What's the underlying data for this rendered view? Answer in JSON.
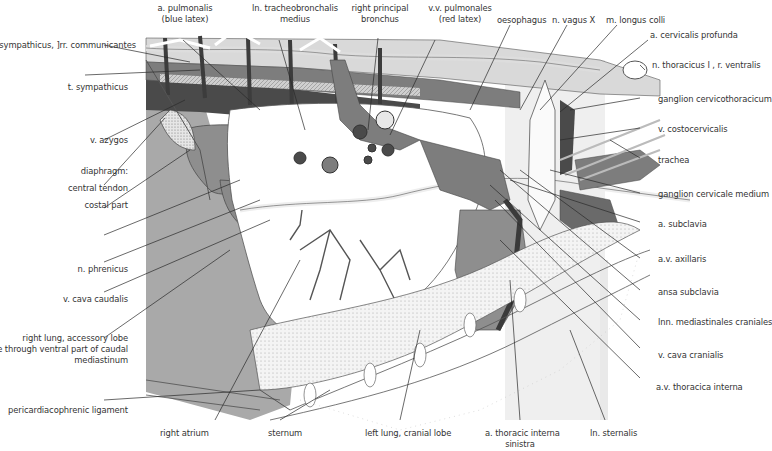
{
  "figure": {
    "type": "anatomical illustration",
    "colors": {
      "background": "#ffffff",
      "lung_gray": "#a9a9a9",
      "dark_vessel": "#4a4a4a",
      "mid_vessel": "#7d7d7d",
      "light_tissue": "#d6d6d6",
      "leader_line": "#2a2a2a",
      "label_text": "#333333"
    }
  },
  "labels": {
    "top": [
      {
        "id": "a_pulmonalis",
        "lines": [
          "a. pulmonalis",
          "(blue latex)"
        ]
      },
      {
        "id": "ln_tracheobronchalis",
        "lines": [
          "ln. tracheobronchalis",
          "medius"
        ]
      },
      {
        "id": "right_principal_bronchus",
        "lines": [
          "right principal",
          "bronchus"
        ]
      },
      {
        "id": "vv_pulmonales",
        "lines": [
          "v.v. pulmonales",
          "(red latex)"
        ]
      },
      {
        "id": "oesophagus",
        "lines": [
          "oesophagus"
        ]
      },
      {
        "id": "n_vagus",
        "lines": [
          "n. vagus X"
        ]
      },
      {
        "id": "m_longus_colli",
        "lines": [
          "m. longus  colli"
        ]
      }
    ],
    "left": [
      {
        "id": "t_sympathicus_rr",
        "text": "t. sympathicus, ]rr. communicantes"
      },
      {
        "id": "t_sympathicus",
        "text": "t. sympathicus"
      },
      {
        "id": "v_azygos",
        "text": "v. azygos"
      },
      {
        "id": "diaphragm",
        "text": "diaphragm:"
      },
      {
        "id": "central_tendon",
        "text": "central tendon"
      },
      {
        "id": "costal_part",
        "text": "costal part"
      },
      {
        "id": "n_phrenicus",
        "text": "n. phrenicus"
      },
      {
        "id": "v_cava_caudalis",
        "text": "v. cava caudalis"
      },
      {
        "id": "right_lung_accessory",
        "lines": [
          "right lung, accessory lobe",
          "visible through  ventral part of caudal",
          "mediastinum"
        ]
      },
      {
        "id": "pericardiacophrenic",
        "text": "pericardiacophrenic ligament"
      }
    ],
    "right": [
      {
        "id": "a_cervicalis_profunda",
        "text": "a. cervicalis profunda"
      },
      {
        "id": "n_thoracicus",
        "text": "n. thoracicus I , r. ventralis"
      },
      {
        "id": "ganglion_cervicothoracicum",
        "text": "ganglion cervicothoracicum"
      },
      {
        "id": "v_costocervicalis",
        "text": "v. costocervicalis"
      },
      {
        "id": "trachea",
        "text": "trachea"
      },
      {
        "id": "ganglion_cervicale_medium",
        "text": "ganglion cervicale medium"
      },
      {
        "id": "a_subclavia",
        "text": "a. subclavia"
      },
      {
        "id": "av_axillaris",
        "text": "a.v. axillaris"
      },
      {
        "id": "ansa_subclavia",
        "text": "ansa subclavia"
      },
      {
        "id": "lnn_mediastinales",
        "text": "lnn. mediastinales craniales"
      },
      {
        "id": "v_cava_cranialis",
        "text": "v. cava cranialis"
      },
      {
        "id": "av_thoracica_interna",
        "text": "a.v. thoracica interna"
      }
    ],
    "bottom": [
      {
        "id": "right_atrium",
        "lines": [
          "right atrium"
        ]
      },
      {
        "id": "sternum",
        "lines": [
          "sternum"
        ]
      },
      {
        "id": "left_lung_cranial",
        "lines": [
          "left lung, cranial lobe"
        ]
      },
      {
        "id": "a_thoracic_interna_sinistra",
        "lines": [
          "a. thoracic interna",
          "sinistra"
        ]
      },
      {
        "id": "ln_sternalis",
        "lines": [
          "ln. sternalis"
        ]
      }
    ]
  }
}
